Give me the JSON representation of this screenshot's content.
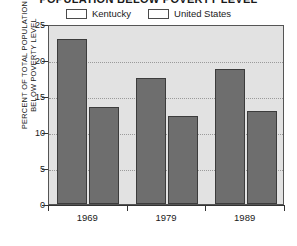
{
  "chart_data": {
    "type": "bar",
    "title": "POPULATION BELOW POVERTY LEVEL",
    "xlabel": "",
    "ylabel": "PERCENT OF TOTAL POPULATION BELOW POVERTY LEVEL",
    "ylabel_lines": [
      "PERCENT OF TOTAL POPULATION",
      "BELOW POVERTY LEVEL"
    ],
    "categories": [
      "1969",
      "1979",
      "1989"
    ],
    "series": [
      {
        "name": "Kentucky",
        "values": [
          22.9,
          17.5,
          18.8
        ],
        "color": "#6e6e6e"
      },
      {
        "name": "United States",
        "values": [
          13.5,
          12.2,
          12.9
        ],
        "color": "#6e6e6e"
      }
    ],
    "ylim": [
      0,
      25
    ],
    "yticks": [
      0,
      5,
      10,
      15,
      20,
      25
    ],
    "ytick_labels": [
      "0",
      "5",
      "10",
      "15",
      "20",
      "25"
    ],
    "grid": true,
    "legend_position": "top",
    "plot_background": "#e2e2e2",
    "axis_color": "#333333",
    "gridline_color": "#9a9a9a"
  }
}
